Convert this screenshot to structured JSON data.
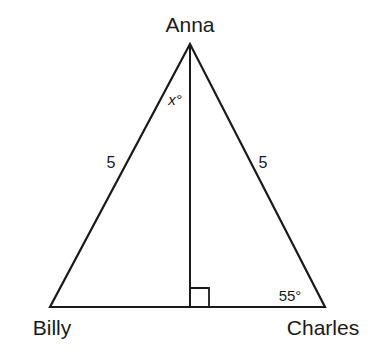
{
  "diagram": {
    "type": "isosceles-triangle",
    "vertices": {
      "top": {
        "name": "Anna"
      },
      "left": {
        "name": "Billy"
      },
      "right": {
        "name": "Charles"
      }
    },
    "sides": {
      "left": {
        "label": "5"
      },
      "right": {
        "label": "5"
      }
    },
    "angles": {
      "apex_half": {
        "label": "x°"
      },
      "right_base": {
        "label": "55°"
      }
    },
    "altitude": {
      "from": "Anna",
      "right_angle_marker": true
    }
  },
  "colors": {
    "stroke": "#1a1a1a",
    "background": "#ffffff"
  }
}
